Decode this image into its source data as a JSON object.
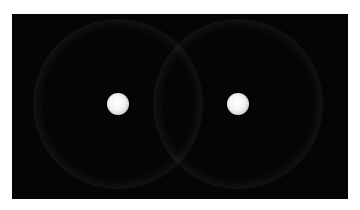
{
  "scene": {
    "background_color": "#ffffff",
    "canvas_color": "#050505",
    "bubbles": [
      {
        "name": "left-bubble",
        "cx": 106,
        "cy": 90,
        "r": 85
      },
      {
        "name": "right-bubble",
        "cx": 226,
        "cy": 90,
        "r": 85
      }
    ],
    "cores": [
      {
        "name": "left-core",
        "cx": 106,
        "cy": 90,
        "r": 11
      },
      {
        "name": "right-core",
        "cx": 226,
        "cy": 90,
        "r": 11
      }
    ]
  }
}
